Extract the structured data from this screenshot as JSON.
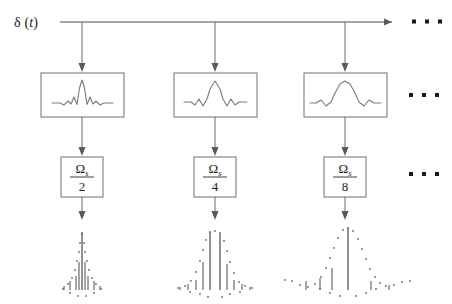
{
  "diagram": {
    "input_label": {
      "symbol": "δ",
      "open_paren": "(",
      "variable": "t",
      "close_paren": ")",
      "full": "δ (t)"
    },
    "ellipsis": {
      "glyph": "▪",
      "count": 3,
      "label": "continues"
    },
    "colors": {
      "line": "#6b6b6b",
      "bus": "#4a4a4a",
      "box_stroke": "#6e6e6e",
      "waveform": "#7a7a7a",
      "text": "#1c1c1c",
      "dot": "#1a1a1a",
      "background": "#ffffff"
    },
    "branches": [
      {
        "index": 1,
        "filter_box": {
          "name": "narrow-sinc-filter",
          "waveform_type": "sinc",
          "lobe_width": "narrow",
          "side_lobes": 1
        },
        "rate_box": {
          "numerator_symbol": "Ω",
          "numerator_subscript": "s",
          "denominator": "2",
          "full": "Ωs/2"
        },
        "output_plot": {
          "name": "sampled-narrow-sinc",
          "waveform_type": "sampled-sinc",
          "peak_amplitude": 1.0,
          "sample_count": 41,
          "main_lobe_half_width": 6
        }
      },
      {
        "index": 2,
        "filter_box": {
          "name": "medium-sinc-filter",
          "waveform_type": "sinc",
          "lobe_width": "medium",
          "side_lobes": 2
        },
        "rate_box": {
          "numerator_symbol": "Ω",
          "numerator_subscript": "s",
          "denominator": "4",
          "full": "Ωs/4"
        },
        "output_plot": {
          "name": "sampled-medium-sinc",
          "waveform_type": "sampled-sinc",
          "peak_amplitude": 1.0,
          "sample_count": 41,
          "main_lobe_half_width": 11
        }
      },
      {
        "index": 3,
        "filter_box": {
          "name": "wide-sinc-filter",
          "waveform_type": "sinc",
          "lobe_width": "wide",
          "side_lobes": 2
        },
        "rate_box": {
          "numerator_symbol": "Ω",
          "numerator_subscript": "s",
          "denominator": "8",
          "full": "Ωs/8"
        },
        "output_plot": {
          "name": "sampled-wide-sinc",
          "waveform_type": "sampled-sinc",
          "peak_amplitude": 1.0,
          "sample_count": 51,
          "main_lobe_half_width": 20
        }
      }
    ]
  }
}
